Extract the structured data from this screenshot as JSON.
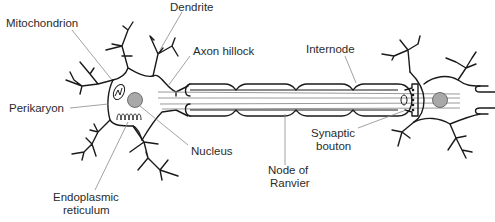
{
  "diagram": {
    "labels": {
      "dendrite": "Dendrite",
      "mitochondrion": "Mitochondrion",
      "axon_hillock": "Axon hillock",
      "internode": "Internode",
      "perikaryon": "Perikaryon",
      "nucleus": "Nucleus",
      "synaptic_bouton_1": "Synaptic",
      "synaptic_bouton_2": "bouton",
      "node_of_ranvier_1": "Node of",
      "node_of_ranvier_2": "Ranvier",
      "endoplasmic_reticulum_1": "Endoplasmic",
      "endoplasmic_reticulum_2": "reticulum"
    },
    "colors": {
      "outline": "#1a1a1a",
      "nucleus_fill": "#a8a8a8",
      "leader_line": "#8a8a8a",
      "text": "#2b2b2b"
    }
  }
}
